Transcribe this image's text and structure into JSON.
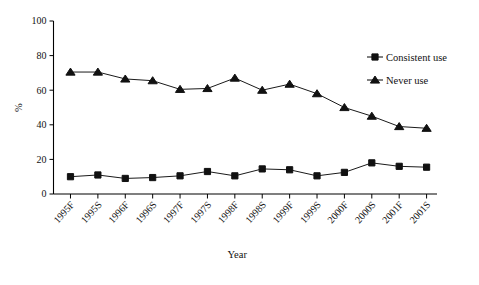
{
  "chart_data": {
    "type": "line",
    "title": "",
    "xlabel": "Year",
    "ylabel": "%",
    "ylim": [
      0,
      100
    ],
    "yticks": [
      0,
      20,
      40,
      60,
      80,
      100
    ],
    "grid": false,
    "legend_position": "top-right",
    "categories": [
      "1995F",
      "1995S",
      "1996F",
      "1996S",
      "1997F",
      "1997S",
      "1998F",
      "1998S",
      "1999F",
      "1999S",
      "2000F",
      "2000S",
      "2001F",
      "2001S"
    ],
    "series": [
      {
        "name": "Consistent use",
        "marker": "square",
        "values": [
          10,
          11,
          9,
          9.5,
          10.5,
          13,
          10.5,
          14.5,
          14,
          10.5,
          12.5,
          18,
          16,
          15.5
        ]
      },
      {
        "name": "Never use",
        "marker": "triangle",
        "values": [
          70.5,
          70.5,
          66.5,
          65.5,
          60.5,
          61,
          67,
          60,
          63.5,
          58,
          50,
          45,
          39,
          38
        ]
      }
    ]
  },
  "legend": {
    "items": [
      {
        "label": "Consistent use",
        "marker": "square"
      },
      {
        "label": "Never use",
        "marker": "triangle"
      }
    ]
  },
  "axes": {
    "y_title": "%",
    "x_title": "Year",
    "y_tick_labels": [
      "0",
      "20",
      "40",
      "60",
      "80",
      "100"
    ],
    "x_tick_labels": [
      "1995F",
      "1995S",
      "1996F",
      "1996S",
      "1997F",
      "1997S",
      "1998F",
      "1998S",
      "1999F",
      "1999S",
      "2000F",
      "2000S",
      "2001F",
      "2001S"
    ]
  },
  "style": {
    "line_color": "#1a1a1a",
    "text_color": "#111111",
    "background": "#ffffff"
  }
}
